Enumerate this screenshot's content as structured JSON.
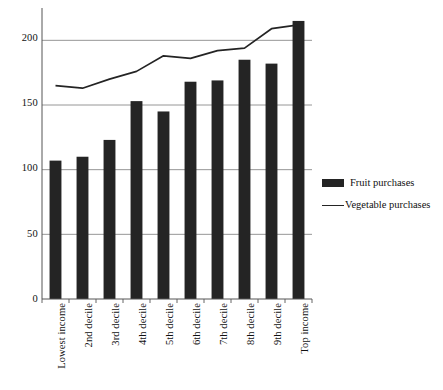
{
  "chart_data": {
    "type": "bar",
    "title": "",
    "subtitle": "",
    "xlabel": "",
    "ylabel": "",
    "ylim": [
      0,
      225
    ],
    "yticks": [
      0,
      50,
      100,
      150,
      200
    ],
    "grid": "horizontal",
    "legend_position": "right",
    "categories": [
      "Lowest income",
      "2nd decile",
      "3rd decile",
      "4th decile",
      "5th decile",
      "6th decile",
      "7th decile",
      "8th decile",
      "9th decile",
      "Top income"
    ],
    "series": [
      {
        "name": "Fruit purchases",
        "type": "bar",
        "color": "#242424",
        "values": [
          107,
          110,
          123,
          153,
          145,
          168,
          169,
          185,
          182,
          215
        ]
      },
      {
        "name": "Vegetable purchases",
        "type": "line",
        "color": "#242424",
        "values": [
          165,
          163,
          170,
          176,
          188,
          186,
          192,
          194,
          209,
          212
        ]
      }
    ]
  },
  "axis": {
    "y_tick_labels": [
      "200",
      "150",
      "100",
      "50",
      "0"
    ]
  },
  "legend": {
    "items": [
      {
        "label": "Fruit purchases",
        "marker": "bar-swatch-icon"
      },
      {
        "label": "Vegetable purchases",
        "marker": "line-swatch-icon"
      }
    ]
  }
}
